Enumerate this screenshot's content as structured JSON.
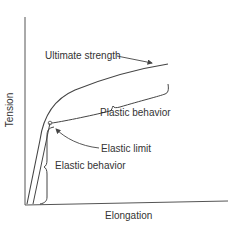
{
  "diagram": {
    "axes": {
      "x_label": "Elongation",
      "y_label": "Tension"
    },
    "annotations": {
      "ultimate_strength": "Ultimate strength",
      "plastic_behavior": "Plastic behavior",
      "elastic_limit": "Elastic limit",
      "elastic_behavior": "Elastic behavior"
    },
    "colors": {
      "line": "#444444",
      "text": "#333333",
      "background": "#ffffff"
    }
  }
}
